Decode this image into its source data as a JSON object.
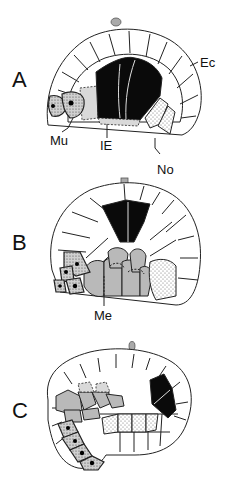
{
  "figure": {
    "panels": [
      {
        "id": "A",
        "label": "A",
        "annotations": [
          "Ec",
          "Mu",
          "IE",
          "No"
        ]
      },
      {
        "id": "B",
        "label": "B",
        "annotations": [
          "Me"
        ]
      },
      {
        "id": "C",
        "label": "C",
        "annotations": []
      }
    ],
    "labels": {
      "ec": "Ec",
      "mu": "Mu",
      "ie": "IE",
      "no": "No",
      "me": "Me"
    },
    "colors": {
      "intestinal_endoderm": "#0a0a0a",
      "mesoderm": "#b9b9b9",
      "ectoderm": "#ffffff",
      "pole": "#aaaaaa"
    }
  }
}
